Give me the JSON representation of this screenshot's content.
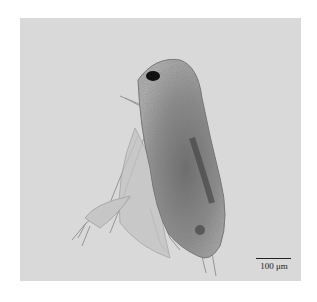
{
  "image": {
    "subject": "copepod specimen under light microscope",
    "background_color": "#d9d9d9",
    "scale_bar": {
      "label": "100 μm"
    }
  }
}
